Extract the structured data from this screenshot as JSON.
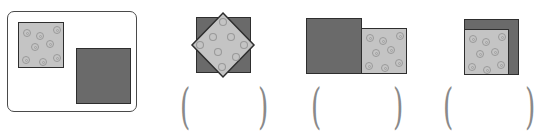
{
  "diagram": {
    "reference_panel": {
      "shapes": [
        "light-patterned-square",
        "dark-square"
      ]
    },
    "options": [
      {
        "id": 1,
        "arrangement": "light square rotated 45° on top of dark square",
        "answer": ""
      },
      {
        "id": 2,
        "arrangement": "dark square next to smaller light square, bottoms aligned",
        "answer": ""
      },
      {
        "id": 3,
        "arrangement": "light square overlapping dark square at bottom-left corner",
        "answer": ""
      }
    ],
    "colors": {
      "dark_fill": "#6a6a6a",
      "light_fill": "#c4c4c4",
      "outline": "#2e2e2e",
      "paren": "#8a8a8a"
    },
    "parens": {
      "open": "(",
      "close": ")"
    }
  }
}
